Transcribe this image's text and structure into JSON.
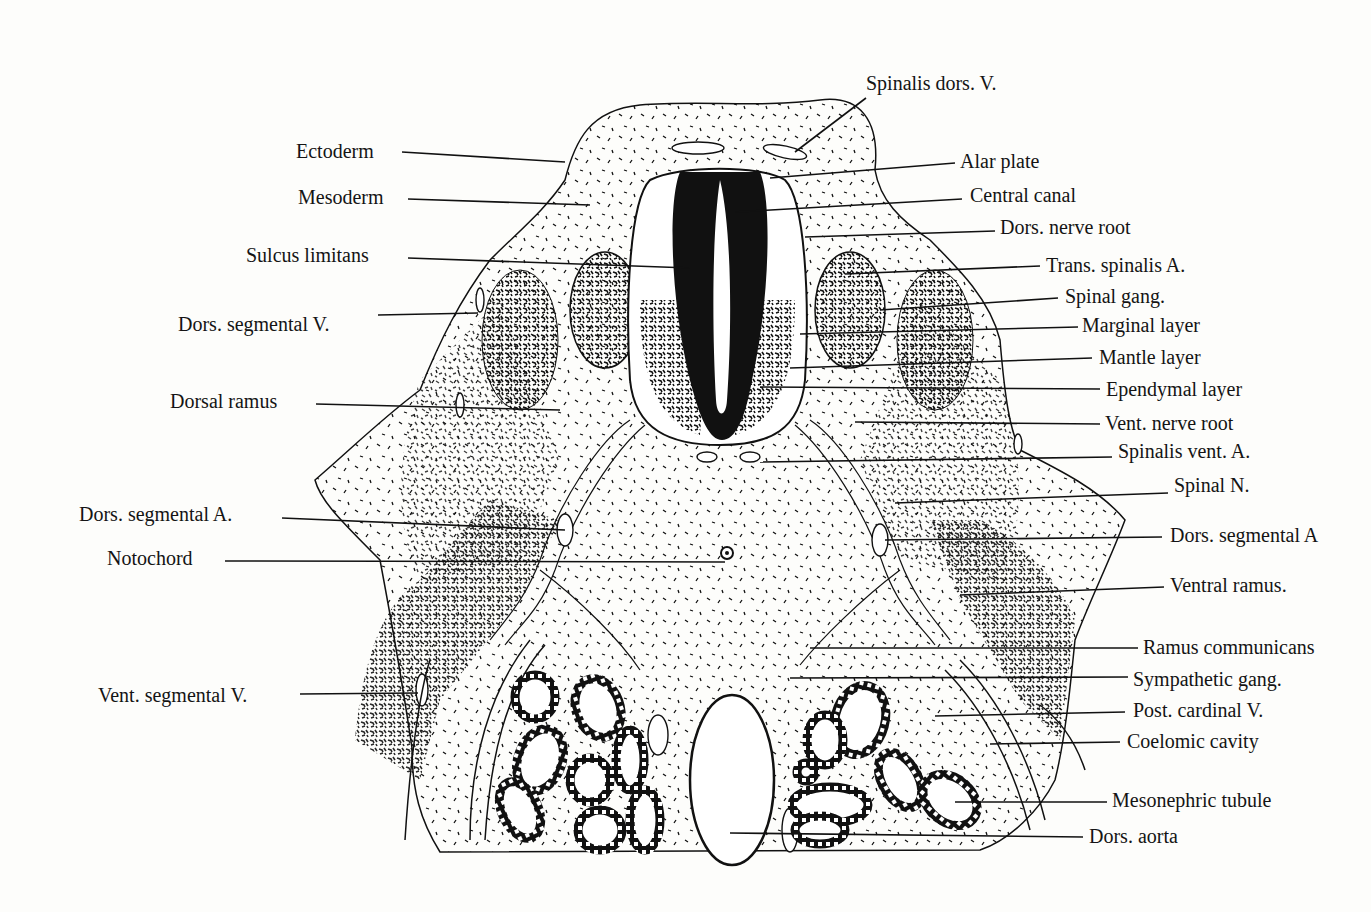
{
  "figure": {
    "labels_left": [
      {
        "id": "ectoderm",
        "text": "Ectoderm",
        "x": 296,
        "y": 140,
        "lx1": 402,
        "ly1": 152,
        "lx2": 565,
        "ly2": 162
      },
      {
        "id": "mesoderm",
        "text": "Mesoderm",
        "x": 298,
        "y": 186,
        "lx1": 408,
        "ly1": 199,
        "lx2": 590,
        "ly2": 205
      },
      {
        "id": "sulcus-limitans",
        "text": "Sulcus limitans",
        "x": 246,
        "y": 244,
        "lx1": 408,
        "ly1": 258,
        "lx2": 690,
        "ly2": 268
      },
      {
        "id": "dors-segmental-v",
        "text": "Dors. segmental V.",
        "x": 178,
        "y": 313,
        "lx1": 378,
        "ly1": 315,
        "lx2": 478,
        "ly2": 313
      },
      {
        "id": "dorsal-ramus",
        "text": "Dorsal ramus",
        "x": 170,
        "y": 390,
        "lx1": 316,
        "ly1": 404,
        "lx2": 560,
        "ly2": 410
      },
      {
        "id": "dors-segmental-a-left",
        "text": "Dors. segmental A.",
        "x": 79,
        "y": 503,
        "lx1": 282,
        "ly1": 518,
        "lx2": 565,
        "ly2": 530
      },
      {
        "id": "notochord",
        "text": "Notochord",
        "x": 107,
        "y": 547,
        "lx1": 225,
        "ly1": 561,
        "lx2": 725,
        "ly2": 562
      },
      {
        "id": "vent-segmental-v",
        "text": "Vent. segmental V.",
        "x": 98,
        "y": 684,
        "lx1": 300,
        "ly1": 694,
        "lx2": 418,
        "ly2": 693
      }
    ],
    "labels_right": [
      {
        "id": "spinalis-dors-v",
        "text": "Spinalis dors. V.",
        "x": 866,
        "y": 72,
        "lx1": 866,
        "ly1": 98,
        "lx2": 795,
        "ly2": 152
      },
      {
        "id": "alar-plate",
        "text": "Alar plate",
        "x": 960,
        "y": 150,
        "lx1": 955,
        "ly1": 163,
        "lx2": 770,
        "ly2": 178
      },
      {
        "id": "central-canal",
        "text": "Central canal",
        "x": 970,
        "y": 184,
        "lx1": 962,
        "ly1": 199,
        "lx2": 735,
        "ly2": 212
      },
      {
        "id": "dors-nerve-root",
        "text": "Dors. nerve root",
        "x": 1000,
        "y": 216,
        "lx1": 995,
        "ly1": 231,
        "lx2": 805,
        "ly2": 237
      },
      {
        "id": "trans-spinalis-a",
        "text": "Trans. spinalis A.",
        "x": 1046,
        "y": 254,
        "lx1": 1040,
        "ly1": 266,
        "lx2": 845,
        "ly2": 274
      },
      {
        "id": "spinal-gang",
        "text": "Spinal gang.",
        "x": 1065,
        "y": 285,
        "lx1": 1058,
        "ly1": 298,
        "lx2": 880,
        "ly2": 310
      },
      {
        "id": "marginal-layer",
        "text": "Marginal layer",
        "x": 1082,
        "y": 314,
        "lx1": 1078,
        "ly1": 327,
        "lx2": 800,
        "ly2": 334
      },
      {
        "id": "mantle-layer",
        "text": "Mantle layer",
        "x": 1099,
        "y": 346,
        "lx1": 1092,
        "ly1": 358,
        "lx2": 790,
        "ly2": 368
      },
      {
        "id": "ependymal-layer",
        "text": "Ependymal layer",
        "x": 1106,
        "y": 378,
        "lx1": 1100,
        "ly1": 389,
        "lx2": 760,
        "ly2": 387
      },
      {
        "id": "vent-nerve-root",
        "text": "Vent. nerve root",
        "x": 1105,
        "y": 412,
        "lx1": 1100,
        "ly1": 424,
        "lx2": 855,
        "ly2": 422
      },
      {
        "id": "spinalis-vent-a",
        "text": "Spinalis vent. A.",
        "x": 1118,
        "y": 440,
        "lx1": 1112,
        "ly1": 457,
        "lx2": 760,
        "ly2": 462
      },
      {
        "id": "spinal-n",
        "text": "Spinal N.",
        "x": 1174,
        "y": 474,
        "lx1": 1168,
        "ly1": 493,
        "lx2": 895,
        "ly2": 503
      },
      {
        "id": "dors-segmental-a-right",
        "text": "Dors. segmental A",
        "x": 1170,
        "y": 524,
        "lx1": 1162,
        "ly1": 537,
        "lx2": 885,
        "ly2": 540
      },
      {
        "id": "ventral-ramus",
        "text": "Ventral ramus.",
        "x": 1170,
        "y": 574,
        "lx1": 1164,
        "ly1": 587,
        "lx2": 960,
        "ly2": 595
      },
      {
        "id": "ramus-communicans",
        "text": "Ramus communicans",
        "x": 1143,
        "y": 636,
        "lx1": 1138,
        "ly1": 648,
        "lx2": 810,
        "ly2": 648
      },
      {
        "id": "sympathetic-gang",
        "text": "Sympathetic gang.",
        "x": 1133,
        "y": 668,
        "lx1": 1128,
        "ly1": 677,
        "lx2": 790,
        "ly2": 678
      },
      {
        "id": "post-cardinal-v",
        "text": "Post. cardinal V.",
        "x": 1133,
        "y": 699,
        "lx1": 1125,
        "ly1": 712,
        "lx2": 935,
        "ly2": 716
      },
      {
        "id": "coelomic-cavity",
        "text": "Coelomic cavity",
        "x": 1127,
        "y": 730,
        "lx1": 1120,
        "ly1": 742,
        "lx2": 990,
        "ly2": 744
      },
      {
        "id": "mesonephric-tubule",
        "text": "Mesonephric tubule",
        "x": 1112,
        "y": 789,
        "lx1": 1107,
        "ly1": 802,
        "lx2": 955,
        "ly2": 802
      },
      {
        "id": "dors-aorta",
        "text": "Dors. aorta",
        "x": 1089,
        "y": 825,
        "lx1": 1083,
        "ly1": 837,
        "lx2": 730,
        "ly2": 833
      }
    ],
    "colors": {
      "ink": "#111111",
      "paper": "#fdfdfb",
      "lumen": "#ffffff"
    }
  }
}
